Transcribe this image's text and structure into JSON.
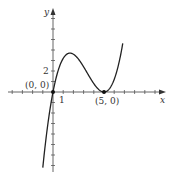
{
  "chart_data": {
    "type": "line",
    "title": "",
    "xlabel": "x",
    "ylabel": "y",
    "function": "y = x(x - 5)^2 / 5",
    "xlim": [
      -4.5,
      11
    ],
    "ylim": [
      -7.5,
      8
    ],
    "grid": false,
    "x_tick_labels": [
      {
        "value": 1,
        "label": "1"
      }
    ],
    "y_tick_labels": [
      {
        "value": 2,
        "label": "2"
      }
    ],
    "annotations": [
      {
        "x": 0,
        "y": 0,
        "label": "(0, 0)"
      },
      {
        "x": 5,
        "y": 0,
        "label": "(5, 0)"
      }
    ],
    "series": [
      {
        "name": "f(x)",
        "x": [
          -1,
          -0.5,
          0,
          0.5,
          1,
          1.5,
          1.67,
          2,
          2.5,
          3,
          3.5,
          4,
          4.5,
          5,
          5.5,
          6,
          6.5,
          6.85
        ],
        "y": [
          -7.2,
          -3.03,
          0,
          2.03,
          3.2,
          3.68,
          3.7,
          3.6,
          3.13,
          2.4,
          1.58,
          0.8,
          0.23,
          0,
          0.28,
          1.2,
          2.93,
          4.69
        ]
      }
    ]
  },
  "labels": {
    "x_axis": "x",
    "y_axis": "y",
    "tick_x1": "1",
    "tick_y2": "2",
    "point_origin": "(0, 0)",
    "point_root": "(5, 0)"
  },
  "colors": {
    "axis": "#444444",
    "curve": "#222222",
    "point": "#111111"
  }
}
